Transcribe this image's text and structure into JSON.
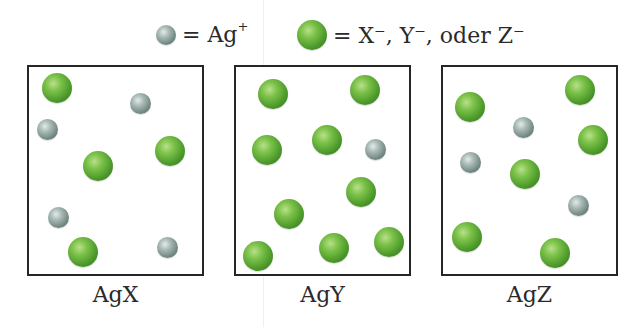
{
  "legend": {
    "silver": {
      "symbol": "Ag",
      "charge": "+",
      "ball": "gray",
      "prefix": "= "
    },
    "anion": {
      "text": "= X⁻, Y⁻, oder Z⁻",
      "ball": "green"
    }
  },
  "colors": {
    "green_ion": "#5aa832",
    "gray_ion": "#8a9c98",
    "border": "#262626"
  },
  "boxes": [
    {
      "label": "AgX",
      "left": 27,
      "width": 177,
      "ions": [
        {
          "type": "green",
          "x": 57,
          "y": 88
        },
        {
          "type": "gray",
          "x": 140,
          "y": 103
        },
        {
          "type": "gray",
          "x": 47,
          "y": 129
        },
        {
          "type": "green",
          "x": 98,
          "y": 166
        },
        {
          "type": "green",
          "x": 170,
          "y": 151
        },
        {
          "type": "gray",
          "x": 58,
          "y": 217
        },
        {
          "type": "green",
          "x": 83,
          "y": 252
        },
        {
          "type": "gray",
          "x": 167,
          "y": 247
        }
      ]
    },
    {
      "label": "AgY",
      "left": 234,
      "width": 177,
      "ions": [
        {
          "type": "green",
          "x": 273,
          "y": 94
        },
        {
          "type": "green",
          "x": 365,
          "y": 90
        },
        {
          "type": "green",
          "x": 267,
          "y": 150
        },
        {
          "type": "green",
          "x": 327,
          "y": 140
        },
        {
          "type": "gray",
          "x": 375,
          "y": 149
        },
        {
          "type": "green",
          "x": 361,
          "y": 192
        },
        {
          "type": "green",
          "x": 289,
          "y": 214
        },
        {
          "type": "green",
          "x": 258,
          "y": 256
        },
        {
          "type": "green",
          "x": 334,
          "y": 248
        },
        {
          "type": "green",
          "x": 389,
          "y": 242
        }
      ]
    },
    {
      "label": "AgZ",
      "left": 441,
      "width": 177,
      "ions": [
        {
          "type": "green",
          "x": 470,
          "y": 107
        },
        {
          "type": "green",
          "x": 580,
          "y": 90
        },
        {
          "type": "gray",
          "x": 523,
          "y": 127
        },
        {
          "type": "green",
          "x": 593,
          "y": 140
        },
        {
          "type": "gray",
          "x": 470,
          "y": 162
        },
        {
          "type": "green",
          "x": 525,
          "y": 174
        },
        {
          "type": "gray",
          "x": 578,
          "y": 205
        },
        {
          "type": "green",
          "x": 467,
          "y": 237
        },
        {
          "type": "green",
          "x": 555,
          "y": 253
        }
      ]
    }
  ]
}
